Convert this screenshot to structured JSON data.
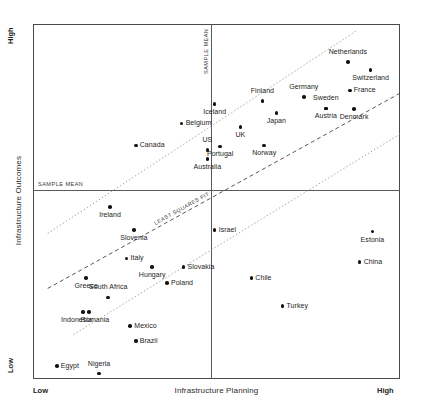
{
  "chart_data": {
    "type": "scatter",
    "title": "",
    "xlabel": "Infrastructure Planning",
    "ylabel": "Infrastructure Outcomes",
    "xlim": [
      0,
      100
    ],
    "ylim": [
      0,
      100
    ],
    "x_low_label": "Low",
    "x_high_label": "High",
    "y_low_label": "Low",
    "y_high_label": "High",
    "grid": false,
    "legend": "none",
    "annotations": {
      "sample_mean_horizontal": "SAMPLE MEAN",
      "sample_mean_vertical": "SAMPLE MEAN",
      "least_squares_fit": "LEAST SQUARES FIT"
    },
    "reference_lines": {
      "sample_mean_x": 48.5,
      "sample_mean_y": 53.2,
      "least_squares_fit": {
        "style": "dashed",
        "x1": 4.0,
        "y1": 25.5,
        "x2": 100.0,
        "y2": 80.5
      },
      "upper_band": {
        "style": "dotted",
        "x1": 4.0,
        "y1": 41.0,
        "x2": 88.0,
        "y2": 98.0
      },
      "lower_band": {
        "style": "dotted",
        "x1": 11.0,
        "y1": 12.5,
        "x2": 100.0,
        "y2": 69.0
      }
    },
    "points": [
      {
        "label": "Netherlands",
        "x": 85.8,
        "y": 89.3,
        "labelpos": "above"
      },
      {
        "label": "Switzerland",
        "x": 92.0,
        "y": 87.1,
        "labelpos": "below"
      },
      {
        "label": "France",
        "x": 86.3,
        "y": 81.3,
        "labelpos": "right"
      },
      {
        "label": "Germany",
        "x": 73.8,
        "y": 79.5,
        "labelpos": "above"
      },
      {
        "label": "Sweden",
        "x": 79.8,
        "y": 76.2,
        "labelpos": "above"
      },
      {
        "label": "Denmark",
        "x": 87.5,
        "y": 76.0,
        "labelpos": "below"
      },
      {
        "label": "Austria",
        "x": 79.8,
        "y": 76.2,
        "labelpos": "below"
      },
      {
        "label": "Finland",
        "x": 62.5,
        "y": 78.3,
        "labelpos": "above"
      },
      {
        "label": "Japan",
        "x": 66.3,
        "y": 75.0,
        "labelpos": "below"
      },
      {
        "label": "Iceland",
        "x": 49.5,
        "y": 77.5,
        "labelpos": "below"
      },
      {
        "label": "UK",
        "x": 56.5,
        "y": 71.0,
        "labelpos": "below"
      },
      {
        "label": "Norway",
        "x": 63.0,
        "y": 65.8,
        "labelpos": "below"
      },
      {
        "label": "Belgium",
        "x": 40.5,
        "y": 72.0,
        "labelpos": "right"
      },
      {
        "label": "Canada",
        "x": 28.0,
        "y": 65.8,
        "labelpos": "right"
      },
      {
        "label": "US",
        "x": 47.5,
        "y": 64.5,
        "labelpos": "above"
      },
      {
        "label": "Portugal",
        "x": 51.0,
        "y": 65.5,
        "labelpos": "below"
      },
      {
        "label": "Australia",
        "x": 47.5,
        "y": 62.0,
        "labelpos": "below"
      },
      {
        "label": "Ireland",
        "x": 21.0,
        "y": 48.5,
        "labelpos": "below"
      },
      {
        "label": "Slovenia",
        "x": 27.5,
        "y": 42.0,
        "labelpos": "below"
      },
      {
        "label": "Italy",
        "x": 25.5,
        "y": 34.0,
        "labelpos": "right"
      },
      {
        "label": "Hungary",
        "x": 32.5,
        "y": 31.5,
        "labelpos": "below"
      },
      {
        "label": "Greece",
        "x": 14.5,
        "y": 28.5,
        "labelpos": "below"
      },
      {
        "label": "Slovakia",
        "x": 41.0,
        "y": 31.5,
        "labelpos": "right"
      },
      {
        "label": "Poland",
        "x": 36.5,
        "y": 27.0,
        "labelpos": "right"
      },
      {
        "label": "South Africa",
        "x": 20.5,
        "y": 23.0,
        "labelpos": "above"
      },
      {
        "label": "Indonesia",
        "x": 13.7,
        "y": 18.8,
        "labelpos": "bl"
      },
      {
        "label": "Romania",
        "x": 15.2,
        "y": 18.8,
        "labelpos": "br"
      },
      {
        "label": "Mexico",
        "x": 26.5,
        "y": 15.0,
        "labelpos": "right"
      },
      {
        "label": "Brazil",
        "x": 28.0,
        "y": 10.7,
        "labelpos": "right"
      },
      {
        "label": "Egypt",
        "x": 6.5,
        "y": 3.7,
        "labelpos": "right"
      },
      {
        "label": "Nigeria",
        "x": 18.0,
        "y": 1.5,
        "labelpos": "above"
      },
      {
        "label": "Israel",
        "x": 49.5,
        "y": 42.0,
        "labelpos": "right"
      },
      {
        "label": "Chile",
        "x": 59.5,
        "y": 28.5,
        "labelpos": "right"
      },
      {
        "label": "Turkey",
        "x": 68.0,
        "y": 20.5,
        "labelpos": "right"
      },
      {
        "label": "Estonia",
        "x": 92.5,
        "y": 41.5,
        "labelpos": "below"
      },
      {
        "label": "China",
        "x": 89.0,
        "y": 33.0,
        "labelpos": "right"
      }
    ]
  }
}
